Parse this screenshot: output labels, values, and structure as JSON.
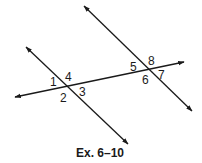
{
  "figure": {
    "caption": "Ex. 6–10",
    "line_color": "#1a1a1a",
    "lines": [
      {
        "name": "transversal",
        "x1": 15,
        "y1": 97,
        "x2": 184,
        "y2": 62
      },
      {
        "name": "left-parallel",
        "x1": 26,
        "y1": 47,
        "x2": 128,
        "y2": 144
      },
      {
        "name": "right-parallel",
        "x1": 84,
        "y1": 6,
        "x2": 192,
        "y2": 111
      }
    ],
    "angles": [
      {
        "label": "1",
        "x": 50,
        "y": 86
      },
      {
        "label": "4",
        "x": 65,
        "y": 81
      },
      {
        "label": "2",
        "x": 60,
        "y": 102
      },
      {
        "label": "3",
        "x": 79,
        "y": 96
      },
      {
        "label": "5",
        "x": 130,
        "y": 71
      },
      {
        "label": "8",
        "x": 148,
        "y": 65
      },
      {
        "label": "6",
        "x": 142,
        "y": 84
      },
      {
        "label": "7",
        "x": 158,
        "y": 79
      }
    ]
  }
}
